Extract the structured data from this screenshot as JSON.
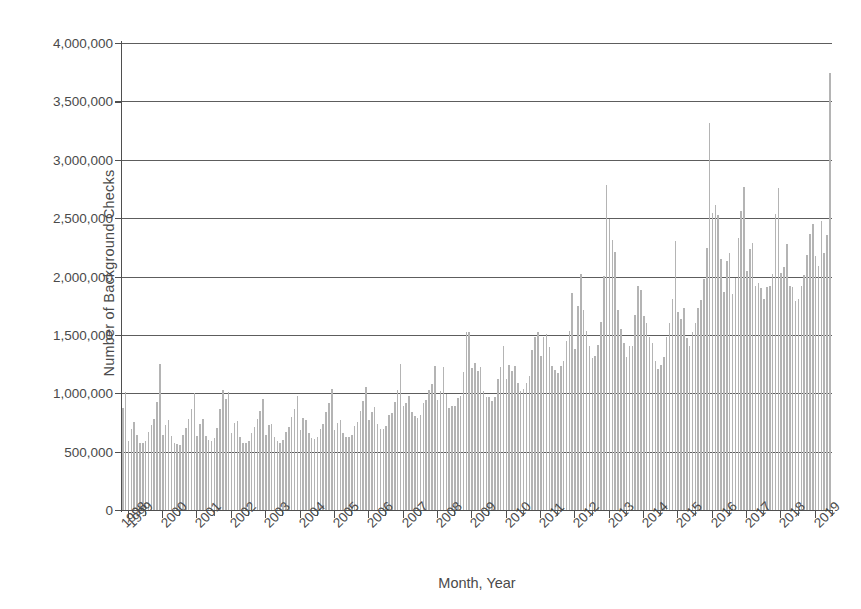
{
  "chart_data": {
    "type": "bar",
    "title": "",
    "xlabel": "Month, Year",
    "ylabel": "Number of Background Checks",
    "ylim": [
      0,
      4000000
    ],
    "ytick_values": [
      0,
      500000,
      1000000,
      1500000,
      2000000,
      2500000,
      3000000,
      3500000,
      4000000
    ],
    "ytick_labels": [
      "0",
      "500,000",
      "1,000,000",
      "1,500,000",
      "2,000,000",
      "2,500,000",
      "3,000,000",
      "3,500,000",
      "4,000,000"
    ],
    "xtick_labels": [
      "1998",
      "1999",
      "2000",
      "2001",
      "2002",
      "2003",
      "2004",
      "2005",
      "2006",
      "2007",
      "2008",
      "2009",
      "2010",
      "2011",
      "2012",
      "2013",
      "2014",
      "2015",
      "2016",
      "2017",
      "2018",
      "2019"
    ],
    "xtick_rotation": -45,
    "grid": true,
    "legend": false,
    "bar_color": "#b4b4b4",
    "axis_color": "#4f4f4f",
    "x_start_label": "1998-11",
    "x_end_label": "2019-06",
    "x_unit": "month",
    "categories": [
      "1998-11",
      "1998-12",
      "1999-01",
      "1999-02",
      "1999-03",
      "1999-04",
      "1999-05",
      "1999-06",
      "1999-07",
      "1999-08",
      "1999-09",
      "1999-10",
      "1999-11",
      "1999-12",
      "2000-01",
      "2000-02",
      "2000-03",
      "2000-04",
      "2000-05",
      "2000-06",
      "2000-07",
      "2000-08",
      "2000-09",
      "2000-10",
      "2000-11",
      "2000-12",
      "2001-01",
      "2001-02",
      "2001-03",
      "2001-04",
      "2001-05",
      "2001-06",
      "2001-07",
      "2001-08",
      "2001-09",
      "2001-10",
      "2001-11",
      "2001-12",
      "2002-01",
      "2002-02",
      "2002-03",
      "2002-04",
      "2002-05",
      "2002-06",
      "2002-07",
      "2002-08",
      "2002-09",
      "2002-10",
      "2002-11",
      "2002-12",
      "2003-01",
      "2003-02",
      "2003-03",
      "2003-04",
      "2003-05",
      "2003-06",
      "2003-07",
      "2003-08",
      "2003-09",
      "2003-10",
      "2003-11",
      "2003-12",
      "2004-01",
      "2004-02",
      "2004-03",
      "2004-04",
      "2004-05",
      "2004-06",
      "2004-07",
      "2004-08",
      "2004-09",
      "2004-10",
      "2004-11",
      "2004-12",
      "2005-01",
      "2005-02",
      "2005-03",
      "2005-04",
      "2005-05",
      "2005-06",
      "2005-07",
      "2005-08",
      "2005-09",
      "2005-10",
      "2005-11",
      "2005-12",
      "2006-01",
      "2006-02",
      "2006-03",
      "2006-04",
      "2006-05",
      "2006-06",
      "2006-07",
      "2006-08",
      "2006-09",
      "2006-10",
      "2006-11",
      "2006-12",
      "2007-01",
      "2007-02",
      "2007-03",
      "2007-04",
      "2007-05",
      "2007-06",
      "2007-07",
      "2007-08",
      "2007-09",
      "2007-10",
      "2007-11",
      "2007-12",
      "2008-01",
      "2008-02",
      "2008-03",
      "2008-04",
      "2008-05",
      "2008-06",
      "2008-07",
      "2008-08",
      "2008-09",
      "2008-10",
      "2008-11",
      "2008-12",
      "2009-01",
      "2009-02",
      "2009-03",
      "2009-04",
      "2009-05",
      "2009-06",
      "2009-07",
      "2009-08",
      "2009-09",
      "2009-10",
      "2009-11",
      "2009-12",
      "2010-01",
      "2010-02",
      "2010-03",
      "2010-04",
      "2010-05",
      "2010-06",
      "2010-07",
      "2010-08",
      "2010-09",
      "2010-10",
      "2010-11",
      "2010-12",
      "2011-01",
      "2011-02",
      "2011-03",
      "2011-04",
      "2011-05",
      "2011-06",
      "2011-07",
      "2011-08",
      "2011-09",
      "2011-10",
      "2011-11",
      "2011-12",
      "2012-01",
      "2012-02",
      "2012-03",
      "2012-04",
      "2012-05",
      "2012-06",
      "2012-07",
      "2012-08",
      "2012-09",
      "2012-10",
      "2012-11",
      "2012-12",
      "2013-01",
      "2013-02",
      "2013-03",
      "2013-04",
      "2013-05",
      "2013-06",
      "2013-07",
      "2013-08",
      "2013-09",
      "2013-10",
      "2013-11",
      "2013-12",
      "2014-01",
      "2014-02",
      "2014-03",
      "2014-04",
      "2014-05",
      "2014-06",
      "2014-07",
      "2014-08",
      "2014-09",
      "2014-10",
      "2014-11",
      "2014-12",
      "2015-01",
      "2015-02",
      "2015-03",
      "2015-04",
      "2015-05",
      "2015-06",
      "2015-07",
      "2015-08",
      "2015-09",
      "2015-10",
      "2015-11",
      "2015-12",
      "2016-01",
      "2016-02",
      "2016-03",
      "2016-04",
      "2016-05",
      "2016-06",
      "2016-07",
      "2016-08",
      "2016-09",
      "2016-10",
      "2016-11",
      "2016-12",
      "2017-01",
      "2017-02",
      "2017-03",
      "2017-04",
      "2017-05",
      "2017-06",
      "2017-07",
      "2017-08",
      "2017-09",
      "2017-10",
      "2017-11",
      "2017-12",
      "2018-01",
      "2018-02",
      "2018-03",
      "2018-04",
      "2018-05",
      "2018-06",
      "2018-07",
      "2018-08",
      "2018-09",
      "2018-10",
      "2018-11",
      "2018-12",
      "2019-01",
      "2019-02",
      "2019-03",
      "2019-04",
      "2019-05",
      "2019-06"
    ],
    "values": [
      870000,
      1015000,
      591000,
      696000,
      753000,
      646000,
      573000,
      577000,
      591000,
      670000,
      729000,
      782000,
      929000,
      1253000,
      639000,
      731000,
      768000,
      633000,
      570000,
      563000,
      561000,
      646000,
      699000,
      778000,
      869000,
      1005000,
      638000,
      736000,
      780000,
      630000,
      600000,
      594000,
      620000,
      703000,
      864000,
      1026000,
      953000,
      1010000,
      656000,
      747000,
      760000,
      622000,
      578000,
      570000,
      588000,
      657000,
      709000,
      783000,
      851000,
      953000,
      646000,
      727000,
      741000,
      626000,
      588000,
      574000,
      601000,
      668000,
      714000,
      799000,
      869000,
      980000,
      686000,
      784000,
      772000,
      659000,
      615000,
      609000,
      622000,
      690000,
      739000,
      840000,
      920000,
      1035000,
      685000,
      743000,
      770000,
      662000,
      626000,
      622000,
      646000,
      719000,
      755000,
      852000,
      934000,
      1056000,
      775000,
      843000,
      879000,
      739000,
      697000,
      697000,
      718000,
      810000,
      833000,
      929000,
      1027000,
      1253000,
      894000,
      914000,
      975000,
      840000,
      803000,
      792000,
      810000,
      917000,
      943000,
      1026000,
      1079000,
      1231000,
      942000,
      1021000,
      1225000,
      994000,
      872000,
      891000,
      891000,
      956000,
      973000,
      1183000,
      1529000,
      1523000,
      1213000,
      1259000,
      1191000,
      1225000,
      1023000,
      968000,
      966000,
      937000,
      969000,
      1119000,
      1223000,
      1407000,
      1119000,
      1243000,
      1191000,
      1234000,
      1090000,
      1022000,
      1039000,
      1089000,
      1145000,
      1368000,
      1480000,
      1521000,
      1323000,
      1485000,
      1508000,
      1392000,
      1230000,
      1197000,
      1177000,
      1232000,
      1273000,
      1448000,
      1534000,
      1862000,
      1377000,
      1749000,
      2020000,
      1714000,
      1534000,
      1406000,
      1300000,
      1322000,
      1413000,
      1614000,
      2006000,
      2783000,
      2495000,
      2309000,
      2209000,
      1714000,
      1548000,
      1427000,
      1308000,
      1404000,
      1403000,
      1671000,
      1917000,
      1886000,
      1660000,
      1601000,
      1486000,
      1429000,
      1280000,
      1210000,
      1243000,
      1308000,
      1478000,
      1601000,
      1807000,
      2308000,
      1697000,
      1634000,
      1729000,
      1472000,
      1407000,
      1529000,
      1600000,
      1731000,
      1800000,
      1976000,
      2243000,
      3314000,
      2545000,
      2613000,
      2523000,
      2146000,
      1870000,
      2131000,
      2198000,
      1853000,
      1990000,
      2334000,
      2561000,
      2771000,
      2043000,
      2234000,
      2290000,
      1922000,
      1943000,
      1901000,
      1810000,
      1914000,
      1921000,
      2021000,
      2535000,
      2760000,
      2030000,
      2078000,
      2276000,
      1916000,
      1910000,
      1792000,
      1809000,
      1922000,
      2009000,
      2188000,
      2364000,
      2448000,
      2172000,
      2093000,
      2474000,
      2201000,
      2353000,
      3740000
    ]
  },
  "accessibility": {
    "description": "Monthly number of firearm background checks, November 1998 through mid-2019, showing a rising trend with pronounced December peaks."
  }
}
